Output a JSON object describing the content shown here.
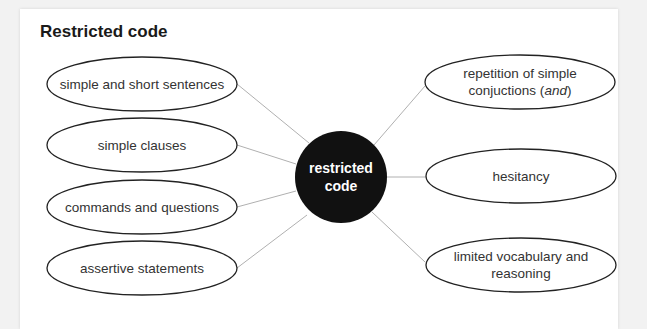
{
  "title": "Restricted code",
  "center": {
    "label": "restricted code",
    "fill": "#111111"
  },
  "colors": {
    "line": "#b0b0b0",
    "ellipse_stroke": "#222222",
    "text": "#333333"
  },
  "left_nodes": [
    {
      "label": "simple and short sentences"
    },
    {
      "label": "simple clauses"
    },
    {
      "label": "commands and questions"
    },
    {
      "label": "assertive statements"
    }
  ],
  "right_nodes": [
    {
      "label_main": "repetition of simple conjuctions (",
      "label_italic": "and",
      "label_end": ")"
    },
    {
      "label": "hesitancy"
    },
    {
      "label": "limited vocabulary and reasoning"
    }
  ]
}
